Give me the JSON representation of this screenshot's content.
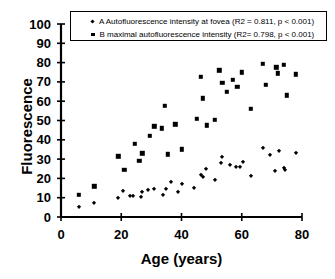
{
  "chart_data": {
    "type": "scatter",
    "title": "",
    "xlabel": "Age (years)",
    "ylabel": "Fluorescence",
    "xlim": [
      0,
      80
    ],
    "ylim": [
      0,
      100
    ],
    "xticks": [
      0,
      20,
      40,
      60,
      80
    ],
    "yticks": [
      0,
      10,
      20,
      30,
      40,
      50,
      60,
      70,
      80,
      90,
      100
    ],
    "grid": false,
    "legend_position": "top-center",
    "series": [
      {
        "name": "A",
        "marker": "diamond",
        "color": "#000000",
        "legend_label": "A Autofluorescence intensity at fovea (R2 = 0.811, p < 0.001)",
        "r2": 0.811,
        "p_value": "< 0.001",
        "points": [
          [
            6,
            5
          ],
          [
            11,
            7
          ],
          [
            19,
            10
          ],
          [
            20.5,
            13.5
          ],
          [
            23,
            11
          ],
          [
            24,
            11
          ],
          [
            26.5,
            10.5
          ],
          [
            27,
            13
          ],
          [
            29,
            14
          ],
          [
            31,
            14.5
          ],
          [
            34,
            11.5
          ],
          [
            35,
            14.5
          ],
          [
            36.5,
            18
          ],
          [
            39,
            13
          ],
          [
            40,
            17
          ],
          [
            44,
            15
          ],
          [
            46.5,
            22
          ],
          [
            47,
            20.5
          ],
          [
            48,
            25
          ],
          [
            51,
            19
          ],
          [
            53,
            28
          ],
          [
            53.5,
            31
          ],
          [
            56,
            27
          ],
          [
            58,
            26
          ],
          [
            59.5,
            26
          ],
          [
            60.5,
            28.5
          ],
          [
            63,
            21
          ],
          [
            67,
            35.5
          ],
          [
            69.5,
            32
          ],
          [
            71,
            24
          ],
          [
            72.5,
            34
          ],
          [
            74,
            25.5
          ],
          [
            74.5,
            24.5
          ],
          [
            78,
            33
          ]
        ]
      },
      {
        "name": "B",
        "marker": "square",
        "color": "#000000",
        "legend_label": "B maximal autofluorescence intensity (R2= 0.798, p < 0.001)",
        "r2": 0.798,
        "p_value": "< 0.001",
        "points": [
          [
            6,
            11.5
          ],
          [
            11,
            16
          ],
          [
            19,
            31.5
          ],
          [
            21,
            24.5
          ],
          [
            24.5,
            38
          ],
          [
            26,
            29
          ],
          [
            27,
            33
          ],
          [
            29.5,
            42
          ],
          [
            31,
            47
          ],
          [
            33.5,
            46
          ],
          [
            34.5,
            57.5
          ],
          [
            35.5,
            32.5
          ],
          [
            38,
            48
          ],
          [
            40,
            35
          ],
          [
            45,
            51
          ],
          [
            46.5,
            72.5
          ],
          [
            47,
            61.5
          ],
          [
            48.5,
            47.5
          ],
          [
            51,
            50.5
          ],
          [
            52.5,
            76
          ],
          [
            53.5,
            69.5
          ],
          [
            55,
            65
          ],
          [
            57,
            71
          ],
          [
            58.5,
            67.5
          ],
          [
            60,
            75
          ],
          [
            63,
            56
          ],
          [
            67,
            79.5
          ],
          [
            68,
            68.5
          ],
          [
            71.5,
            77.5
          ],
          [
            72,
            74.5
          ],
          [
            74,
            79
          ],
          [
            75,
            63
          ],
          [
            78,
            74
          ]
        ]
      }
    ]
  }
}
